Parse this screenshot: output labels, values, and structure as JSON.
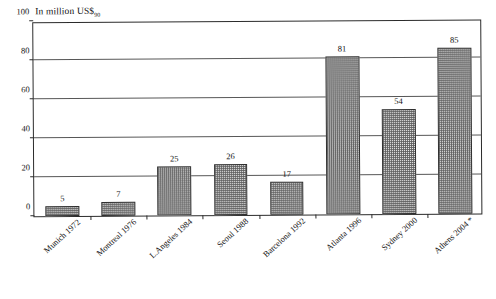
{
  "chart_data": {
    "type": "bar",
    "title": "",
    "subtitle": "",
    "caption": "In million US$",
    "caption_subscript": "90",
    "xlabel": "",
    "ylabel": "In million US$90",
    "ylim": [
      0,
      100
    ],
    "yticks": [
      100,
      80,
      60,
      40,
      20,
      0
    ],
    "grid": true,
    "grid_axis": "y",
    "legend": "none",
    "categories": [
      "Munich 1972",
      "Montreal 1976",
      "L.Angeles 1984",
      "Seoul 1988",
      "Barcelona 1992",
      "Atlanta 1996",
      "Sydney 2000",
      "Athens 2004 *"
    ],
    "values": [
      5,
      7,
      25,
      26,
      17,
      81,
      54,
      85
    ],
    "data_labels": [
      "5",
      "7",
      "25",
      "26",
      "17",
      "81",
      "54",
      "85"
    ],
    "bar_fill": "#e9e9e9",
    "bar_pattern": "fine-checker-hatch",
    "bar_border": "#2f2f2f",
    "footnote_marker": "*",
    "axis_color": "#2b2b2b",
    "gridline_color": "#575757",
    "background": "#ffffff"
  }
}
